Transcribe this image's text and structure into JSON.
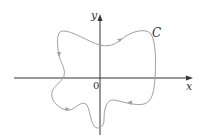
{
  "diagram": {
    "type": "closed-curve-on-axes",
    "axes": {
      "x_label": "x",
      "y_label": "y",
      "origin_label": "0"
    },
    "curve": {
      "label": "C",
      "orientation": "counterclockwise",
      "color": "#a0a0a0"
    },
    "axis_color": "#333333"
  }
}
